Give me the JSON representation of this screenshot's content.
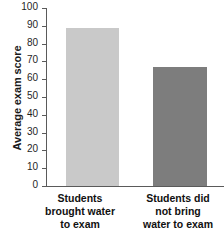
{
  "chart_data": {
    "type": "bar",
    "title": "",
    "xlabel": "",
    "ylabel": "Average exam score",
    "categories": [
      "Students brought water to exam",
      "Students did not bring water to exam"
    ],
    "values": [
      89,
      67
    ],
    "ylim": [
      0,
      100
    ],
    "ytick_labels": [
      "100",
      "90",
      "80",
      "70",
      "60",
      "50",
      "40",
      "30",
      "20",
      "10",
      "0"
    ],
    "ytick_values": [
      100,
      90,
      80,
      70,
      60,
      50,
      40,
      30,
      20,
      10,
      0
    ],
    "grid": false,
    "legend": false,
    "bar_colors": [
      "#c9c9c9",
      "#7d7d7d"
    ],
    "axis_color": "#5a5a5a"
  },
  "axis": {
    "y_title": "Average exam score"
  },
  "category_labels": {
    "bar1_line1": "Students",
    "bar1_line2": "brought water",
    "bar1_line3": "to exam",
    "bar2_line1": "Students did",
    "bar2_line2": "not bring",
    "bar2_line3": "water to exam"
  },
  "ticks": {
    "t0": "100",
    "t1": "90",
    "t2": "80",
    "t3": "70",
    "t4": "60",
    "t5": "50",
    "t6": "40",
    "t7": "30",
    "t8": "20",
    "t9": "10",
    "t10": "0"
  }
}
